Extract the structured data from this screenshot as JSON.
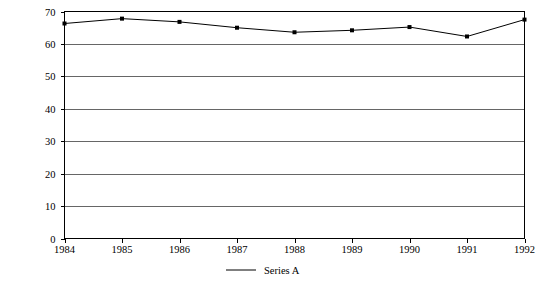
{
  "chart_data": {
    "type": "line",
    "title": "",
    "subtitle": "",
    "xlabel": "",
    "ylabel": "",
    "x": [
      1984,
      1985,
      1986,
      1987,
      1988,
      1989,
      1990,
      1991,
      1992
    ],
    "xtick_labels": [
      "1984",
      "1985",
      "1986",
      "1987",
      "1988",
      "1989",
      "1990",
      "1991",
      "1992"
    ],
    "ytick_labels": [
      "0",
      "10",
      "20",
      "30",
      "40",
      "50",
      "60",
      "70"
    ],
    "yticks": [
      0,
      10,
      20,
      30,
      40,
      50,
      60,
      70
    ],
    "ylim": [
      0,
      70
    ],
    "xlim": [
      1984,
      1992
    ],
    "grid": "horizontal",
    "legend_position": "bottom-center",
    "series": [
      {
        "name": "Series A",
        "color": "#000000",
        "marker": "square",
        "values": [
          66.3,
          67.8,
          66.8,
          65.0,
          63.6,
          64.2,
          65.2,
          62.3,
          67.5
        ]
      }
    ],
    "legend": [
      {
        "label": "Series A",
        "color": "#000000"
      }
    ]
  },
  "colors": {
    "background": "#ffffff",
    "axis": "#000000",
    "gridline": "#555555",
    "series_a": "#000000"
  }
}
